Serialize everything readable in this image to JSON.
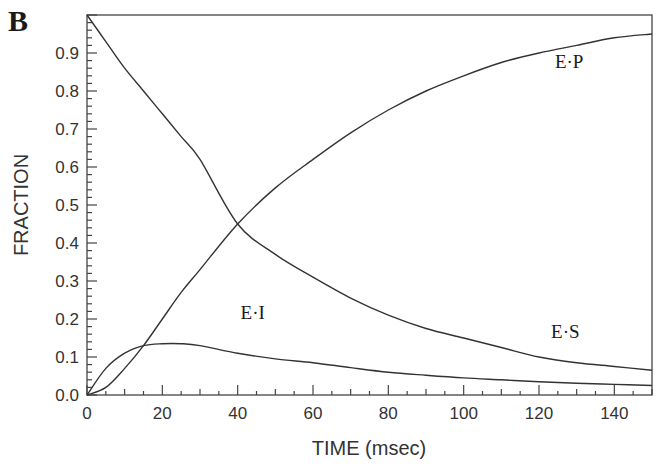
{
  "panel_label": "B",
  "chart_data": {
    "type": "line",
    "title": "",
    "xlabel": "TIME (msec)",
    "ylabel": "FRACTION",
    "xlim": [
      0,
      150
    ],
    "ylim": [
      0,
      1.0
    ],
    "grid": false,
    "legend": "inline curve labels",
    "x_ticks": [
      0,
      20,
      40,
      60,
      80,
      100,
      120,
      140
    ],
    "y_ticks": [
      0.0,
      0.1,
      0.2,
      0.3,
      0.4,
      0.5,
      0.6,
      0.7,
      0.8,
      0.9
    ],
    "x_tick_labels": [
      "0",
      "20",
      "40",
      "60",
      "80",
      "100",
      "120",
      "140"
    ],
    "y_tick_labels": [
      "0.0",
      "0.1",
      "0.2",
      "0.3",
      "0.4",
      "0.5",
      "0.6",
      "0.7",
      "0.8",
      "0.9"
    ],
    "x": [
      0,
      5,
      10,
      15,
      20,
      25,
      30,
      40,
      50,
      60,
      70,
      80,
      90,
      100,
      110,
      120,
      130,
      140,
      150
    ],
    "series": [
      {
        "name": "E·S",
        "label_pos": [
          127,
          0.15
        ],
        "values": [
          1.0,
          0.93,
          0.86,
          0.8,
          0.74,
          0.68,
          0.62,
          0.45,
          0.37,
          0.31,
          0.255,
          0.21,
          0.175,
          0.15,
          0.125,
          0.1,
          0.085,
          0.075,
          0.065
        ]
      },
      {
        "name": "E·P",
        "label_pos": [
          128,
          0.86
        ],
        "values": [
          0.0,
          0.02,
          0.07,
          0.13,
          0.2,
          0.27,
          0.33,
          0.45,
          0.545,
          0.62,
          0.69,
          0.75,
          0.8,
          0.84,
          0.875,
          0.9,
          0.92,
          0.94,
          0.95
        ]
      },
      {
        "name": "E·I",
        "label_pos": [
          44,
          0.2
        ],
        "values": [
          0.0,
          0.07,
          0.11,
          0.13,
          0.135,
          0.135,
          0.13,
          0.11,
          0.095,
          0.085,
          0.072,
          0.06,
          0.052,
          0.045,
          0.04,
          0.035,
          0.031,
          0.028,
          0.025
        ]
      }
    ]
  }
}
